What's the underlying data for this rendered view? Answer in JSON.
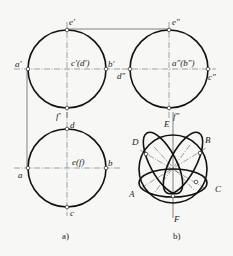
{
  "figure": {
    "views": {
      "front": {
        "center": [
          67,
          69
        ],
        "radius": 39,
        "labels": {
          "top": "e′",
          "left": "a′",
          "right": "b′",
          "bottom": "f′",
          "center": "c′(d′)"
        }
      },
      "side": {
        "center": [
          169,
          69
        ],
        "radius": 39,
        "labels": {
          "top": "e″",
          "left": "d″",
          "right": "c″",
          "bottom": "f″",
          "center": "a″(b″)"
        }
      },
      "top": {
        "center": [
          67,
          168
        ],
        "radius": 39,
        "labels": {
          "top": "d",
          "left": "a",
          "right": "b",
          "bottom": "c",
          "center": "e(f)"
        }
      },
      "sphere": {
        "center": [
          173,
          169
        ],
        "radius": 34,
        "labels": {
          "E": "E",
          "F": "F",
          "A": "A",
          "B": "B",
          "C": "C",
          "D": "D"
        }
      }
    },
    "captions": {
      "a": "a)",
      "b": "b)"
    }
  }
}
